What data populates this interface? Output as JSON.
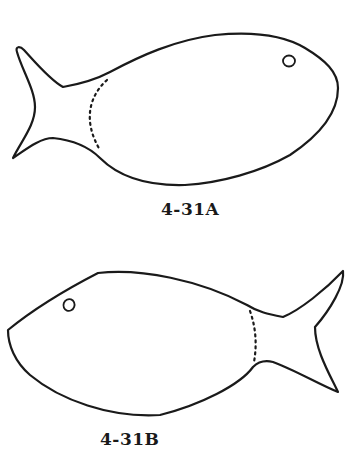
{
  "figures": [
    {
      "id": "A",
      "label": "4-31A",
      "orientation": "facing-right",
      "parts": [
        "body-outline",
        "tail-fin",
        "eye",
        "dotted-cut-line"
      ]
    },
    {
      "id": "B",
      "label": "4-31B",
      "orientation": "facing-left",
      "parts": [
        "body-outline",
        "tail-fin",
        "eye",
        "dotted-cut-line"
      ]
    }
  ],
  "colors": {
    "stroke": "#1a1a1a",
    "background": "#ffffff"
  }
}
